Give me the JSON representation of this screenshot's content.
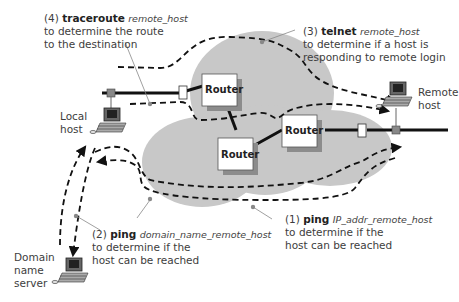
{
  "annotations": [
    {
      "num": "(4)",
      "cmd": "traceroute",
      "arg": "remote_host",
      "lines": [
        "to determine the route",
        "to the destination"
      ]
    },
    {
      "num": "(3)",
      "cmd": "telnet",
      "arg": "remote_host",
      "lines": [
        "to determine if a host is",
        "responding to remote login"
      ]
    },
    {
      "num": "(2)",
      "cmd": "ping",
      "arg": "domain_name_remote_host",
      "lines": [
        "to determine if the",
        "host can be reached"
      ]
    },
    {
      "num": "(1)",
      "cmd": "ping",
      "arg": "IP_addr_remote_host",
      "lines": [
        "to determine if the",
        "host can be reached"
      ]
    }
  ],
  "hosts": {
    "local": [
      "Local",
      "host"
    ],
    "remote": [
      "Remote",
      "host"
    ],
    "dns": [
      "Domain",
      "name",
      "server"
    ]
  },
  "routers": [
    "Router",
    "Router",
    "Router"
  ],
  "colors": {
    "cloud": "#c8c8c8",
    "router_fill": "#ffffff",
    "router_shadow": "#8c8c8c",
    "line": "#111111",
    "connector": "#8a8a8a"
  }
}
